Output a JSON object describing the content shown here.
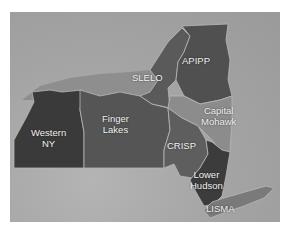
{
  "map": {
    "title": "",
    "colors": {
      "background_satellite": "#a8a8a8",
      "lake_water": "#8e8e8e",
      "western_ny": "#3a3a3a",
      "finger_lakes": "#555555",
      "slelo": "#5a5a5a",
      "apipp": "#505050",
      "capital_mohawk": "#8c8c8c",
      "crisp": "#5e5e5e",
      "lower_hudson": "#3c3c3c",
      "lisma": "#7a7a7a",
      "border": "#b8b8b8"
    },
    "regions": [
      {
        "id": "western-ny",
        "label_line1": "Western",
        "label_line2": "NY"
      },
      {
        "id": "finger-lakes",
        "label_line1": "Finger",
        "label_line2": "Lakes"
      },
      {
        "id": "slelo",
        "label_line1": "SLELO",
        "label_line2": ""
      },
      {
        "id": "apipp",
        "label_line1": "APIPP",
        "label_line2": ""
      },
      {
        "id": "capital-mohawk",
        "label_line1": "Capital",
        "label_line2": "Mohawk"
      },
      {
        "id": "crisp",
        "label_line1": "CRISP",
        "label_line2": ""
      },
      {
        "id": "lower-hudson",
        "label_line1": "Lower",
        "label_line2": "Hudson"
      },
      {
        "id": "lisma",
        "label_line1": "LISMA",
        "label_line2": ""
      }
    ]
  }
}
